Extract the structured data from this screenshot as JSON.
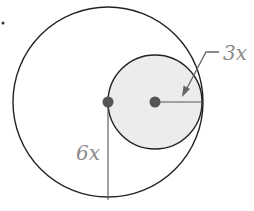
{
  "diagram": {
    "title": "",
    "labels": {
      "small_radius": "3x",
      "large_radius": "6x"
    },
    "shapes": {
      "large_circle": {
        "cx": 108,
        "cy": 102,
        "r": 95,
        "fill": "#ffffff",
        "stroke": "#222222"
      },
      "small_circle": {
        "cx": 155,
        "cy": 102,
        "r": 47,
        "fill": "#ececec",
        "stroke": "#222222"
      },
      "large_center_dot": {
        "cx": 108,
        "cy": 102,
        "r": 5,
        "fill": "#555555"
      },
      "small_center_dot": {
        "cx": 155,
        "cy": 102,
        "r": 5,
        "fill": "#555555"
      }
    },
    "colors": {
      "outline": "#222222",
      "label": "#8a8a8a",
      "shaded_fill": "#ececec",
      "dot": "#555555",
      "leader": "#666666"
    },
    "relationship": "Small circle (radius 3x) is internally tangent to large circle (radius 6x); small circle passes through the large circle's center."
  }
}
